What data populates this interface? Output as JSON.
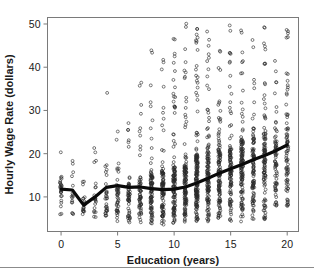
{
  "chart_data": {
    "type": "scatter",
    "title": "",
    "xlabel": "Education (years)",
    "ylabel": "Hourly Wage Rate (dollars)",
    "xlim": [
      -1.2,
      21.0
    ],
    "ylim": [
      2.0,
      51.5
    ],
    "xticks": [
      0,
      5,
      10,
      15,
      20
    ],
    "xticklabels": [
      "0",
      "5",
      "10",
      "15",
      "20"
    ],
    "yticks": [
      10,
      20,
      30,
      40,
      50
    ],
    "yticklabels": [
      "10",
      "20",
      "30",
      "40",
      "50"
    ],
    "grid": false,
    "legend": null,
    "marker": "open-circle",
    "marker_color": "#2a2a2a",
    "trend_color": "#0a0a0a",
    "frame_color": "#7a7a7a",
    "series": [
      {
        "name": "Hourly wage observations",
        "note": "Dense vertical strips of open circles at each integer education year; counts and vertical extent per year.",
        "columns": [
          {
            "x": 0,
            "n": 26,
            "ymin": 5.2,
            "ymax": 21.5,
            "dense_to": 13.0
          },
          {
            "x": 1,
            "n": 16,
            "ymin": 5.0,
            "ymax": 20.0,
            "dense_to": 11.0
          },
          {
            "x": 2,
            "n": 20,
            "ymin": 4.6,
            "ymax": 18.5,
            "dense_to": 10.0
          },
          {
            "x": 3,
            "n": 22,
            "ymin": 4.6,
            "ymax": 22.0,
            "dense_to": 10.5
          },
          {
            "x": 4,
            "n": 30,
            "ymin": 4.4,
            "ymax": 35.0,
            "dense_to": 11.5
          },
          {
            "x": 5,
            "n": 42,
            "ymin": 4.2,
            "ymax": 26.0,
            "dense_to": 12.5
          },
          {
            "x": 6,
            "n": 52,
            "ymin": 4.0,
            "ymax": 28.0,
            "dense_to": 13.5
          },
          {
            "x": 7,
            "n": 58,
            "ymin": 3.8,
            "ymax": 39.0,
            "dense_to": 14.0
          },
          {
            "x": 8,
            "n": 86,
            "ymin": 3.6,
            "ymax": 45.0,
            "dense_to": 15.5
          },
          {
            "x": 9,
            "n": 92,
            "ymin": 3.5,
            "ymax": 44.0,
            "dense_to": 16.0
          },
          {
            "x": 10,
            "n": 112,
            "ymin": 3.4,
            "ymax": 47.0,
            "dense_to": 17.0
          },
          {
            "x": 11,
            "n": 118,
            "ymin": 3.3,
            "ymax": 50.5,
            "dense_to": 17.5
          },
          {
            "x": 12,
            "n": 150,
            "ymin": 3.2,
            "ymax": 50.5,
            "dense_to": 19.5
          },
          {
            "x": 13,
            "n": 120,
            "ymin": 3.4,
            "ymax": 50.0,
            "dense_to": 19.5
          },
          {
            "x": 14,
            "n": 116,
            "ymin": 3.6,
            "ymax": 50.5,
            "dense_to": 20.5
          },
          {
            "x": 15,
            "n": 104,
            "ymin": 4.0,
            "ymax": 50.0,
            "dense_to": 21.0
          },
          {
            "x": 16,
            "n": 120,
            "ymin": 4.2,
            "ymax": 50.5,
            "dense_to": 23.0
          },
          {
            "x": 17,
            "n": 96,
            "ymin": 4.4,
            "ymax": 49.0,
            "dense_to": 23.5
          },
          {
            "x": 18,
            "n": 104,
            "ymin": 4.6,
            "ymax": 50.5,
            "dense_to": 25.0
          },
          {
            "x": 19,
            "n": 70,
            "ymin": 5.6,
            "ymax": 48.0,
            "dense_to": 24.0
          },
          {
            "x": 20,
            "n": 78,
            "ymin": 5.0,
            "ymax": 50.5,
            "dense_to": 25.5
          }
        ]
      }
    ],
    "trend_line": {
      "name": "Nonparametric conditional mean",
      "x": [
        0,
        1,
        2,
        3,
        4,
        5,
        6,
        7,
        8,
        9,
        10,
        11,
        12,
        13,
        14,
        15,
        16,
        17,
        18,
        19,
        20
      ],
      "y": [
        11.8,
        11.6,
        8.1,
        10.0,
        12.2,
        12.6,
        12.2,
        12.3,
        11.9,
        11.7,
        11.8,
        12.3,
        13.2,
        14.3,
        15.5,
        16.5,
        17.5,
        18.6,
        19.6,
        20.7,
        22.0
      ]
    }
  }
}
